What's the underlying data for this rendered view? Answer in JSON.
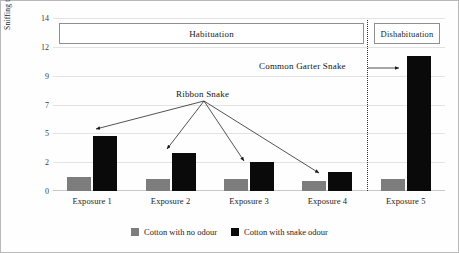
{
  "chart_data": {
    "type": "bar",
    "title": "",
    "xlabel": "",
    "ylabel": "Sniffing time in seconds",
    "ylim": [
      0,
      14
    ],
    "ytick_labels": [
      "14",
      "12",
      "9",
      "7",
      "5",
      "2",
      "0"
    ],
    "ytick_values": [
      14,
      12,
      9,
      7,
      5,
      2,
      0
    ],
    "grid": true,
    "categories": [
      "Exposure 1",
      "Exposure 2",
      "Exposure 3",
      "Exposure 4",
      "Exposure 5"
    ],
    "series": [
      {
        "name": "Cotton with no odour",
        "color": "#7d7d7d",
        "values": [
          1.0,
          0.8,
          0.8,
          0.7,
          0.8
        ]
      },
      {
        "name": "Cotton with snake odour",
        "color": "#0a0a0a",
        "values": [
          4.7,
          3.0,
          2.0,
          1.3,
          11.0
        ]
      }
    ],
    "legend_position": "bottom",
    "annotations": [
      {
        "text": "Ribbon Snake",
        "points_to": [
          "Exposure 1",
          "Exposure 2",
          "Exposure 3",
          "Exposure 4"
        ]
      },
      {
        "text": "Common Garter Snake",
        "points_to": [
          "Exposure 5"
        ]
      }
    ],
    "group_boxes": [
      {
        "label": "Habituation",
        "spans": [
          "Exposure 1",
          "Exposure 2",
          "Exposure 3",
          "Exposure 4"
        ]
      },
      {
        "label": "Dishabituation",
        "spans": [
          "Exposure 5"
        ]
      }
    ]
  },
  "axis": {
    "ylabel": "Sniffing time in seconds",
    "yticks": [
      "14",
      "12",
      "9",
      "7",
      "5",
      "2",
      "0"
    ],
    "xticks": [
      "Exposure 1",
      "Exposure 2",
      "Exposure 3",
      "Exposure 4",
      "Exposure 5"
    ]
  },
  "boxes": {
    "habituation": "Habituation",
    "dishabituation": "Dishabituation"
  },
  "annotations": {
    "ribbon": "Ribbon Snake",
    "garter": "Common Garter Snake"
  },
  "legend": {
    "items": [
      {
        "label": "Cotton with no odour",
        "color": "#7d7d7d"
      },
      {
        "label": "Cotton with snake odour",
        "color": "#0a0a0a"
      }
    ]
  }
}
